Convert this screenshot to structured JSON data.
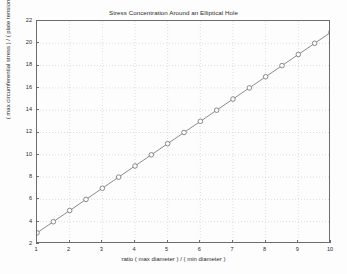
{
  "chart_data": {
    "type": "line",
    "title": "Stress Concentration Around an Elliptical Hole",
    "xlabel": "ratio ( max diameter ) / ( min diameter )",
    "ylabel": "( max circumferential stress ) / ( plate tension at infinity )",
    "xlim": [
      1,
      10
    ],
    "ylim": [
      2,
      22
    ],
    "xticks": [
      1,
      2,
      3,
      4,
      5,
      6,
      7,
      8,
      9,
      10
    ],
    "yticks": [
      2,
      4,
      6,
      8,
      10,
      12,
      14,
      16,
      18,
      20,
      22
    ],
    "xtick_labels": [
      "1",
      "2",
      "3",
      "4",
      "5",
      "6",
      "7",
      "8",
      "9",
      "10"
    ],
    "ytick_labels": [
      "2",
      "4",
      "6",
      "8",
      "10",
      "12",
      "14",
      "16",
      "18",
      "20",
      "22"
    ],
    "grid": true,
    "grid_style": "dotted",
    "legend": null,
    "marker": "circle-open",
    "line_color": "#6e6e6e",
    "marker_color": "#6e6e6e",
    "grid_color": "#c8c8c8",
    "axis_color": "#6d6d6d",
    "background": "#fdfdfd",
    "relation": "y = 2x + 1",
    "x": [
      1,
      1.5,
      2,
      2.5,
      3,
      3.5,
      4,
      4.5,
      5,
      5.5,
      6,
      6.5,
      7,
      7.5,
      8,
      8.5,
      9,
      9.5,
      10
    ],
    "values": [
      3,
      4,
      5,
      6,
      7,
      8,
      9,
      10,
      11,
      12,
      13,
      14,
      15,
      16,
      17,
      18,
      19,
      20,
      21
    ],
    "series": [
      {
        "name": "stress concentration factor",
        "x": [
          1,
          1.5,
          2,
          2.5,
          3,
          3.5,
          4,
          4.5,
          5,
          5.5,
          6,
          6.5,
          7,
          7.5,
          8,
          8.5,
          9,
          9.5,
          10
        ],
        "values": [
          3,
          4,
          5,
          6,
          7,
          8,
          9,
          10,
          11,
          12,
          13,
          14,
          15,
          16,
          17,
          18,
          19,
          20,
          21
        ]
      }
    ]
  }
}
